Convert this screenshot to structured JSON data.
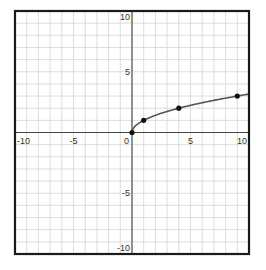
{
  "chart_data": {
    "type": "line",
    "title": "",
    "xlabel": "",
    "ylabel": "",
    "xlim": [
      -10,
      10
    ],
    "ylim": [
      -10,
      10
    ],
    "grid": true,
    "grid_step": 1,
    "function": "y = sqrt(x)",
    "x_tick_labels": [
      "-10",
      "-5",
      "0",
      "5",
      "10"
    ],
    "y_tick_labels": [
      "10",
      "5",
      "-5",
      "-10"
    ],
    "series": [
      {
        "name": "sqrt(x)",
        "curve_x_range": [
          0,
          10
        ],
        "points": [
          {
            "x": 0,
            "y": 0
          },
          {
            "x": 1,
            "y": 1
          },
          {
            "x": 4,
            "y": 2
          },
          {
            "x": 9,
            "y": 3
          }
        ]
      }
    ],
    "legend": null
  },
  "colors": {
    "grid": "#d4d4d4",
    "axis": "#444444",
    "frame": "#1a1a1a",
    "curve": "#555555",
    "point": "#111111"
  }
}
